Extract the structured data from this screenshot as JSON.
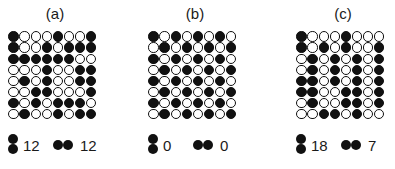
{
  "panels": [
    {
      "label": "(a)",
      "grid": [
        "BWWWBWWB",
        "BWWBWBBB",
        "BBBBBBWW",
        "WWWBWWBB",
        "WBWBWWBB",
        "WWBBWWWB",
        "BWBWBBBW",
        "WBWWBWBB"
      ],
      "vertical_pairs": "12",
      "horizontal_pairs": "12"
    },
    {
      "label": "(b)",
      "grid": [
        "BWBWBWBW",
        "WBWBWBWB",
        "BWBWBWBW",
        "WBWBWBWB",
        "BWBWBWBW",
        "WBWBWBWB",
        "BWBWBWBW",
        "WBWBWBWB"
      ],
      "vertical_pairs": "0",
      "horizontal_pairs": "0"
    },
    {
      "label": "(c)",
      "grid": [
        "BWWWBWWW",
        "BWBWBWWB",
        "WBWBWBWB",
        "WBWBWBWB",
        "BBWBWBWB",
        "BBWWBBWB",
        "WBWWBBWB",
        "WWBBWBWW"
      ],
      "vertical_pairs": "18",
      "horizontal_pairs": "7"
    }
  ],
  "legend_icons": {
    "vertical": "vertical-black-pair-icon",
    "horizontal": "horizontal-black-pair-icon"
  },
  "colors": {
    "black": "#111111",
    "white": "#ffffff"
  }
}
